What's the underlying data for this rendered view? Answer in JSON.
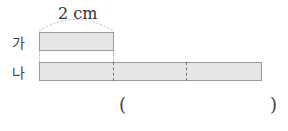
{
  "measure": {
    "label": "2 cm"
  },
  "bars": [
    {
      "name": "가",
      "units": 1
    },
    {
      "name": "나",
      "units": 3
    }
  ],
  "answer": {
    "open": "(",
    "close": ")",
    "value": ""
  },
  "colors": {
    "bar_fill": "#e6e6e6",
    "bar_border": "#9a9a9a"
  }
}
